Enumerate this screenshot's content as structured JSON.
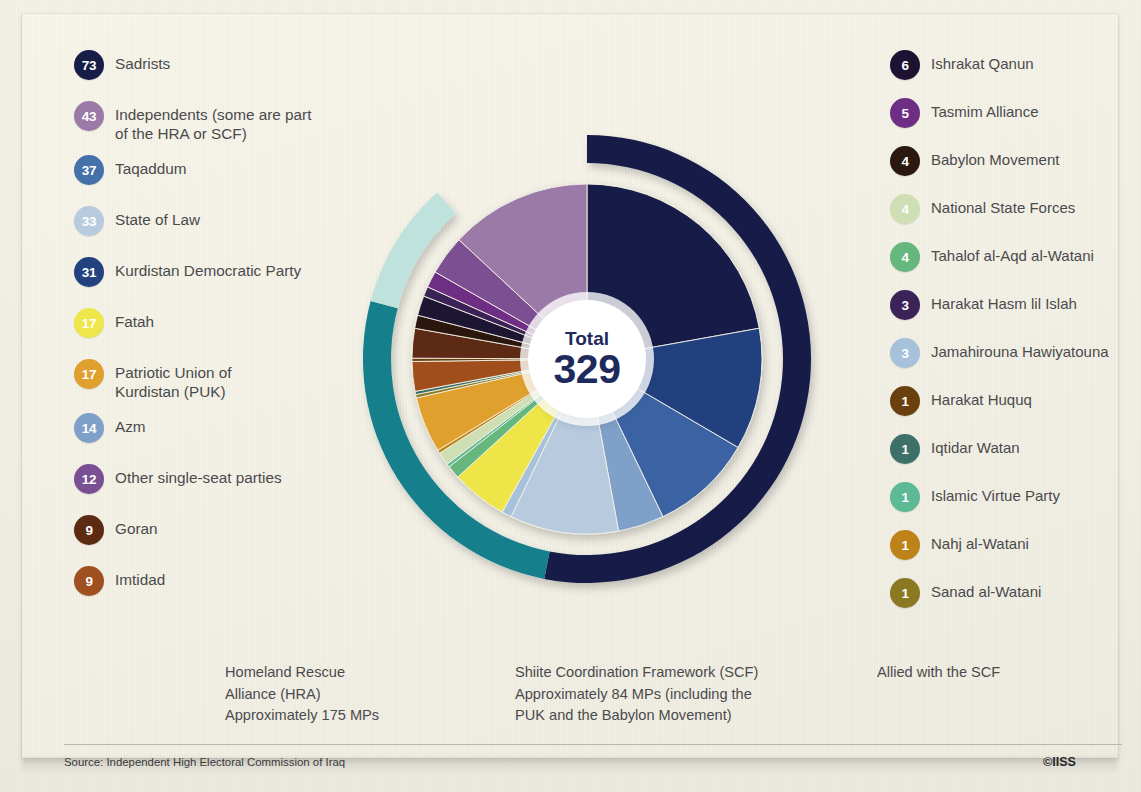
{
  "card": {
    "background_color": "#f4f2e7",
    "total_label": "Total",
    "total_value": "329"
  },
  "legend_left": [
    {
      "seats": "73",
      "label": "Sadrists",
      "color": "#171d46"
    },
    {
      "seats": "43",
      "label": "Independents (some are part\nof the HRA or SCF)",
      "color": "#9b7aa8"
    },
    {
      "seats": "37",
      "label": "Taqaddum",
      "color": "#4571ab"
    },
    {
      "seats": "33",
      "label": "State of Law",
      "color": "#b8cade"
    },
    {
      "seats": "31",
      "label": "Kurdistan Democratic Party",
      "color": "#23417e"
    },
    {
      "seats": "17",
      "label": "Fatah",
      "color": "#eee64a"
    },
    {
      "seats": "17",
      "label": "Patriotic Union of\nKurdistan (PUK)",
      "color": "#e0a02e"
    },
    {
      "seats": "14",
      "label": "Azm",
      "color": "#7fa0c9"
    },
    {
      "seats": "12",
      "label": "Other single-seat parties",
      "color": "#7b4f93"
    },
    {
      "seats": "9",
      "label": "Goran",
      "color": "#5d2a12"
    },
    {
      "seats": "9",
      "label": "Imtidad",
      "color": "#a0501f"
    }
  ],
  "legend_right": [
    {
      "seats": "6",
      "label": "Ishrakat Qanun",
      "color": "#1e1233"
    },
    {
      "seats": "5",
      "label": "Tasmim Alliance",
      "color": "#6e2e83"
    },
    {
      "seats": "4",
      "label": "Babylon Movement",
      "color": "#2b180f"
    },
    {
      "seats": "4",
      "label": "National State Forces",
      "color": "#cfdfb4"
    },
    {
      "seats": "4",
      "label": "Tahalof al-Aqd al-Watani",
      "color": "#66b77e"
    },
    {
      "seats": "3",
      "label": "Harakat Hasm lil Islah",
      "color": "#3b2257"
    },
    {
      "seats": "3",
      "label": "Jamahirouna Hawiyatouna",
      "color": "#a5c2da"
    },
    {
      "seats": "1",
      "label": "Harakat Huquq",
      "color": "#6b400f"
    },
    {
      "seats": "1",
      "label": "Iqtidar Watan",
      "color": "#3d7068"
    },
    {
      "seats": "1",
      "label": "Islamic Virtue Party",
      "color": "#5dba95"
    },
    {
      "seats": "1",
      "label": "Nahj al-Watani",
      "color": "#bd8318"
    },
    {
      "seats": "1",
      "label": "Sanad al-Watani",
      "color": "#8a7920"
    }
  ],
  "bottom_key": [
    {
      "color": "#171d46",
      "text": "Homeland Rescue\nAlliance (HRA)\nApproximately 175 MPs"
    },
    {
      "color": "#147f8c",
      "text": "Shiite Coordination Framework (SCF)\nApproximately 84 MPs (including the\nPUK and the Babylon Movement)"
    },
    {
      "color": "#bfe2dd",
      "text": "Allied with the SCF"
    }
  ],
  "footer": {
    "source": "Source: Independent High Electoral Commission of Iraq",
    "copyright": "©IISS"
  },
  "chart_data": {
    "type": "pie",
    "total": 329,
    "units": "seats",
    "start_angle_deg": 0,
    "direction": "clockwise",
    "categories": [
      "Sadrists",
      "Taqaddum",
      "Kurdistan Democratic Party",
      "Azm",
      "State of Law",
      "Jamahirouna Hawiyatouna",
      "Fatah",
      "Tahalof al-Aqd al-Watani",
      "Islamic Virtue Party",
      "National State Forces",
      "Nahj al-Watani",
      "Patriotic Union of Kurdistan (PUK)",
      "Sanad al-Watani",
      "Iqtidar Watan",
      "Imtidad",
      "Harakat Huquq",
      "Goran",
      "Babylon Movement",
      "Ishrakat Qanun",
      "Harakat Hasm lil Islah",
      "Tasmim Alliance",
      "Other single-seat parties",
      "Independents (some are part of the HRA or SCF)"
    ],
    "values": [
      73,
      37,
      31,
      14,
      33,
      3,
      17,
      4,
      1,
      4,
      1,
      17,
      1,
      1,
      9,
      1,
      9,
      4,
      6,
      3,
      5,
      12,
      43
    ],
    "colors": [
      "#171d46",
      "#23417e",
      "#3a63a3",
      "#7fa0c9",
      "#b8cade",
      "#a5c2da",
      "#eee64a",
      "#66b77e",
      "#5dba95",
      "#cfdfb4",
      "#bd8318",
      "#e0a02e",
      "#8a7920",
      "#3d7068",
      "#a0501f",
      "#6b400f",
      "#5d2a12",
      "#2b180f",
      "#1e1233",
      "#3b2257",
      "#6e2e83",
      "#7b4f93",
      "#9b7aa8"
    ],
    "outer_ring": {
      "label": "Bloc affiliation ring",
      "segments": [
        {
          "name": "Homeland Rescue Alliance (HRA)",
          "color": "#171d46",
          "start_deg": 0,
          "end_deg": 191,
          "mps": 175
        },
        {
          "name": "Shiite Coordination Framework (SCF)",
          "color": "#147f8c",
          "start_deg": 191,
          "end_deg": 285,
          "mps": 84
        },
        {
          "name": "Allied with the SCF",
          "color": "#bfe2dd",
          "start_deg": 285,
          "end_deg": 318
        }
      ]
    },
    "legend_position": "left and right columns",
    "grid": false
  }
}
